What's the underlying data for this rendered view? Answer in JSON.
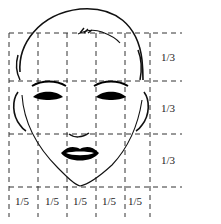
{
  "diagram": {
    "row_labels": [
      "1/3",
      "1/3",
      "1/3"
    ],
    "column_labels": [
      "1/5",
      "1/5",
      "1/5",
      "1/5",
      "1/5"
    ],
    "colors": {
      "line": "#222222",
      "background": "#ffffff"
    }
  }
}
